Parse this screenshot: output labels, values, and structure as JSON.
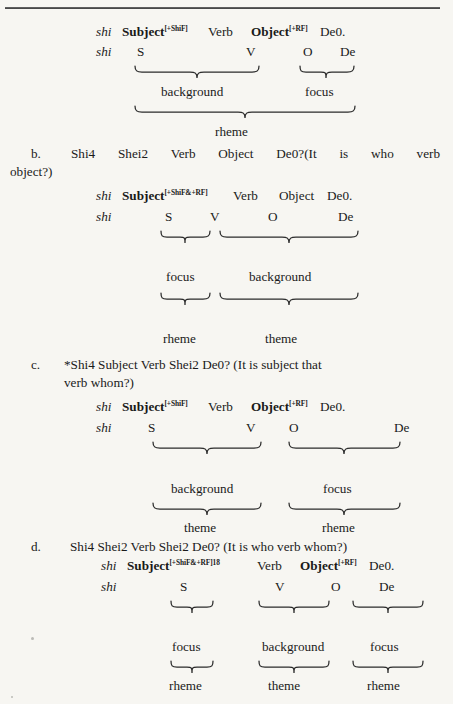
{
  "document": {
    "type": "linguistics-paper-page",
    "background_color": "#f7f6f2",
    "text_color": "#1a1a1a",
    "rule_color": "#4a4a4a"
  },
  "glosses": {
    "shi": "shi",
    "subject": "Subject",
    "object": "Object",
    "verb": "Verb",
    "de0": "De0.",
    "sup_shif": "[+ShiF]",
    "sup_rf": "[+RF]",
    "sup_shif_rf": "[+ShiF&+RF]",
    "sup_shif_rf_note": "[+ShiF&+RF]",
    "footnote_marker": "18",
    "S": "S",
    "V": "V",
    "O": "O",
    "De": "De"
  },
  "labels": {
    "background": "background",
    "focus": "focus",
    "rheme": "rheme",
    "theme": "theme"
  },
  "example_a": {
    "comment": "continuation of example a. from previous page",
    "gloss_line": [
      "shi",
      "Subject",
      "[+ShiF]",
      "Verb",
      "Object",
      "[+RF]",
      "De0."
    ],
    "abbrev_line": [
      "shi",
      "S",
      "V",
      "O",
      "De"
    ],
    "tier1": [
      "background",
      "focus"
    ],
    "tier2": [
      "rheme"
    ]
  },
  "example_b": {
    "letter": "b.",
    "sentence": "Shi4        Shei2        Verb        Object        De0?(It  is  who  verb",
    "sentence_cont": "object?)",
    "sentence_plain": "Shi4 Shei2 Verb Object De0?(It is who verb object?)",
    "gloss_line": [
      "shi",
      "Subject",
      "[+ShiF&+RF]",
      "Verb",
      "Object",
      "De0."
    ],
    "abbrev_line": [
      "shi",
      "S",
      "V",
      "O",
      "De"
    ],
    "tier1": [
      "focus",
      "background"
    ],
    "tier2": [
      "rheme",
      "theme"
    ]
  },
  "example_c": {
    "letter": "c.",
    "sentence": "*Shi4      Subject        Verb         Shei2      De0? (It is subject that",
    "sentence_cont": "verb whom?)",
    "sentence_plain": "*Shi4 Subject Verb Shei2 De0? (It is subject that verb whom?)",
    "gloss_line": [
      "shi",
      "Subject",
      "[+ShiF]",
      "Verb",
      "Object",
      "[+RF]",
      "De0."
    ],
    "abbrev_line": [
      "shi",
      "S",
      "V",
      "O",
      "De"
    ],
    "tier1": [
      "background",
      "focus"
    ],
    "tier2": [
      "theme",
      "rheme"
    ]
  },
  "example_d": {
    "letter": "d.",
    "sentence": "Shi4    Shei2   Verb   Shei2   De0?   (It is who verb whom?)",
    "gloss_line": [
      "shi",
      "Subject",
      "[+ShiF&+RF]",
      "18",
      "Verb",
      "Object",
      "[+RF]",
      "De0."
    ],
    "abbrev_line": [
      "shi",
      "S",
      "V",
      "O",
      "De"
    ],
    "tier1": [
      "focus",
      "background",
      "focus"
    ],
    "tier2": [
      "rheme",
      "theme",
      "rheme"
    ]
  }
}
